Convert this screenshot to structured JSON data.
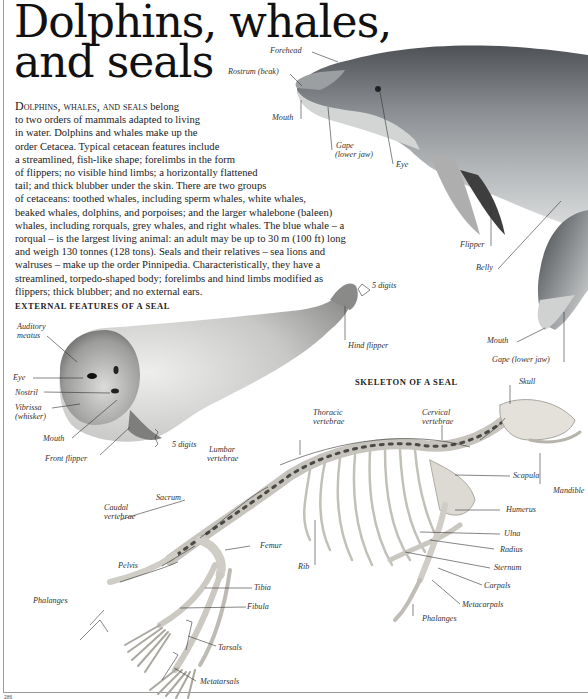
{
  "page": {
    "title_line1": "Dolphins, whales,",
    "title_line2": "and seals",
    "page_number": "286"
  },
  "intro": {
    "lead": "Dolphins, whales, and seals",
    "lines": [
      " belong",
      "to two orders of mammals adapted to living",
      "in water. Dolphins and whales make up the",
      "order Cetacea. Typical cetacean features include",
      "a streamlined, fish-like shape; forelimbs in the form",
      "of flippers; no visible hind limbs; a horizontally flattened",
      "tail; and thick blubber under the skin. There are two groups",
      "of cetaceans: toothed whales, including sperm whales, white whales,",
      "beaked whales, dolphins, and porpoises; and the larger whalebone (baleen)",
      "whales, including rorquals, grey whales, and right whales. The blue whale – a",
      "rorqual – is the largest living animal: an adult may be up to 30 m (100 ft) long",
      "and weigh 130 tonnes (128 tons). Seals and their relatives – sea lions and",
      "walruses – make up the order Pinnipedia. Characteristically, they have a",
      "streamlined, torpedo-shaped body; forelimbs and hind limbs modified as",
      "flippers; thick blubber; and no external ears."
    ]
  },
  "dolphin": {
    "labels": {
      "forehead": "Forehead",
      "rostrum": "Rostrum (beak)",
      "mouth": "Mouth",
      "gape": "Gape",
      "gape_sub": "(lower jaw)",
      "eye": "Eye",
      "flipper": "Flipper",
      "belly": "Belly",
      "mouth2": "Mouth",
      "gape2": "Gape (lower jaw)"
    }
  },
  "seal_external": {
    "heading": "EXTERNAL FEATURES OF A SEAL",
    "labels": {
      "auditory_meatus_1": "Auditory",
      "auditory_meatus_2": "meatus",
      "eye": "Eye",
      "nostril": "Nostril",
      "vibrissa_1": "Vibrissa",
      "vibrissa_2": "(whisker)",
      "mouth": "Mouth",
      "front_flipper": "Front flipper",
      "front_digits": "5 digits",
      "hind_digits": "5 digits",
      "hind_flipper": "Hind flipper"
    }
  },
  "seal_skeleton": {
    "heading": "SKELETON OF A SEAL",
    "labels": {
      "skull": "Skull",
      "thoracic_1": "Thoracic",
      "thoracic_2": "vertebrae",
      "cervical_1": "Cervical",
      "cervical_2": "vertebrae",
      "lumbar_1": "Lumbar",
      "lumbar_2": "vertebrae",
      "scapula": "Scapula",
      "mandible": "Mandible",
      "sacrum": "Sacrum",
      "caudal_1": "Caudal",
      "caudal_2": "vertebrae",
      "humerus": "Humerus",
      "femur": "Femur",
      "ulna": "Ulna",
      "radius": "Radius",
      "pelvis": "Pelvis",
      "rib": "Rib",
      "sternum": "Sternum",
      "carpals": "Carpals",
      "tibia": "Tibia",
      "metacarpals": "Metacarpals",
      "phalanges_hind": "Phalanges",
      "phalanges_fore": "Phalanges",
      "fibula": "Fibula",
      "tarsals": "Tarsals",
      "metatarsals": "Metatarsals"
    }
  },
  "colors": {
    "ink": "#1a1a1a",
    "label": "#333333",
    "rule": "#9a9a9a",
    "dolphin_dark": "#5a5e62",
    "dolphin_light": "#c9cbcc",
    "bone": "#d9d7d0"
  }
}
